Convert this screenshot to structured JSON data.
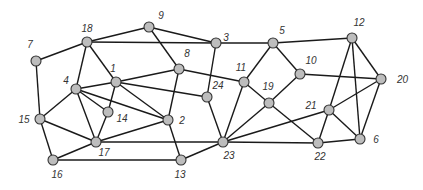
{
  "graph": {
    "nodes": [
      {
        "id": "7",
        "x": 36,
        "y": 61,
        "lx": -6,
        "ly": -13,
        "la": "middle"
      },
      {
        "id": "18",
        "x": 87,
        "y": 42,
        "lx": 0,
        "ly": -10,
        "la": "middle"
      },
      {
        "id": "9",
        "x": 149,
        "y": 27,
        "lx": 12,
        "ly": -8,
        "la": "middle"
      },
      {
        "id": "3",
        "x": 216,
        "y": 43,
        "lx": 10,
        "ly": -2,
        "la": "middle"
      },
      {
        "id": "5",
        "x": 273,
        "y": 43,
        "lx": 9,
        "ly": -9,
        "la": "middle"
      },
      {
        "id": "12",
        "x": 352,
        "y": 38,
        "lx": 7,
        "ly": -12,
        "la": "middle"
      },
      {
        "id": "20",
        "x": 381,
        "y": 79,
        "lx": 16,
        "ly": 4,
        "la": "start"
      },
      {
        "id": "10",
        "x": 300,
        "y": 74,
        "lx": 11,
        "ly": -10,
        "la": "middle"
      },
      {
        "id": "11",
        "x": 244,
        "y": 82,
        "lx": -3,
        "ly": -11,
        "la": "middle"
      },
      {
        "id": "19",
        "x": 269,
        "y": 103,
        "lx": -1,
        "ly": -13,
        "la": "middle"
      },
      {
        "id": "8",
        "x": 179,
        "y": 69,
        "lx": 8,
        "ly": -12,
        "la": "middle"
      },
      {
        "id": "1",
        "x": 116,
        "y": 82,
        "lx": -3,
        "ly": -10,
        "la": "middle"
      },
      {
        "id": "4",
        "x": 76,
        "y": 89,
        "lx": -10,
        "ly": -5,
        "la": "middle"
      },
      {
        "id": "24",
        "x": 207,
        "y": 97,
        "lx": 11,
        "ly": -8,
        "la": "middle"
      },
      {
        "id": "14",
        "x": 108,
        "y": 112,
        "lx": 14,
        "ly": 10,
        "la": "middle"
      },
      {
        "id": "2",
        "x": 168,
        "y": 120,
        "lx": 14,
        "ly": 4,
        "la": "middle"
      },
      {
        "id": "15",
        "x": 40,
        "y": 119,
        "lx": -16,
        "ly": 4,
        "la": "middle"
      },
      {
        "id": "17",
        "x": 96,
        "y": 142,
        "lx": 8,
        "ly": 14,
        "la": "middle"
      },
      {
        "id": "16",
        "x": 53,
        "y": 160,
        "lx": 4,
        "ly": 18,
        "la": "middle"
      },
      {
        "id": "13",
        "x": 181,
        "y": 160,
        "lx": -1,
        "ly": 18,
        "la": "middle"
      },
      {
        "id": "23",
        "x": 223,
        "y": 142,
        "lx": 6,
        "ly": 17,
        "la": "middle"
      },
      {
        "id": "22",
        "x": 318,
        "y": 143,
        "lx": 2,
        "ly": 17,
        "la": "middle"
      },
      {
        "id": "21",
        "x": 329,
        "y": 110,
        "lx": -18,
        "ly": -1,
        "la": "middle"
      },
      {
        "id": "6",
        "x": 360,
        "y": 139,
        "lx": 16,
        "ly": 4,
        "la": "middle"
      }
    ],
    "edges": [
      [
        "7",
        "18"
      ],
      [
        "7",
        "15"
      ],
      [
        "18",
        "9"
      ],
      [
        "18",
        "3"
      ],
      [
        "18",
        "1"
      ],
      [
        "18",
        "4"
      ],
      [
        "9",
        "3"
      ],
      [
        "9",
        "8"
      ],
      [
        "3",
        "5"
      ],
      [
        "3",
        "24"
      ],
      [
        "5",
        "12"
      ],
      [
        "5",
        "11"
      ],
      [
        "5",
        "10"
      ],
      [
        "10",
        "20"
      ],
      [
        "10",
        "19"
      ],
      [
        "11",
        "19"
      ],
      [
        "11",
        "23"
      ],
      [
        "8",
        "1"
      ],
      [
        "8",
        "11"
      ],
      [
        "8",
        "2"
      ],
      [
        "1",
        "24"
      ],
      [
        "1",
        "2"
      ],
      [
        "1",
        "14"
      ],
      [
        "1",
        "4"
      ],
      [
        "4",
        "14"
      ],
      [
        "4",
        "2"
      ],
      [
        "4",
        "15"
      ],
      [
        "4",
        "17"
      ],
      [
        "14",
        "17"
      ],
      [
        "24",
        "23"
      ],
      [
        "2",
        "17"
      ],
      [
        "2",
        "13"
      ],
      [
        "15",
        "17"
      ],
      [
        "15",
        "16"
      ],
      [
        "16",
        "17"
      ],
      [
        "16",
        "13"
      ],
      [
        "17",
        "23"
      ],
      [
        "13",
        "23"
      ],
      [
        "23",
        "19"
      ],
      [
        "23",
        "21"
      ],
      [
        "23",
        "22"
      ],
      [
        "19",
        "22"
      ],
      [
        "12",
        "21"
      ],
      [
        "12",
        "6"
      ],
      [
        "12",
        "20"
      ],
      [
        "20",
        "21"
      ],
      [
        "20",
        "6"
      ],
      [
        "21",
        "22"
      ],
      [
        "21",
        "6"
      ],
      [
        "22",
        "6"
      ]
    ]
  }
}
